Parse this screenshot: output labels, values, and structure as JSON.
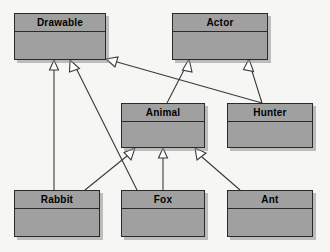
{
  "diagram": {
    "type": "uml-class-diagram",
    "canvas": {
      "width": 330,
      "height": 252
    },
    "style": {
      "background_color": "#f6f6f4",
      "class_fill_color": "#a0a0a0",
      "class_border_color": "#2a2a2a",
      "shadow_color": "#8c8c8c",
      "edge_color": "#3a3a3a",
      "arrowhead_fill": "#ffffff",
      "label_color": "#000000"
    },
    "classes": [
      {
        "id": "drawable",
        "name": "Drawable",
        "x": 14,
        "y": 13,
        "w": 92,
        "h": 47
      },
      {
        "id": "actor",
        "name": "Actor",
        "x": 172,
        "y": 13,
        "w": 96,
        "h": 47
      },
      {
        "id": "animal",
        "name": "Animal",
        "x": 121,
        "y": 103,
        "w": 84,
        "h": 45
      },
      {
        "id": "hunter",
        "name": "Hunter",
        "x": 227,
        "y": 103,
        "w": 86,
        "h": 45
      },
      {
        "id": "rabbit",
        "name": "Rabbit",
        "x": 14,
        "y": 190,
        "w": 86,
        "h": 47
      },
      {
        "id": "fox",
        "name": "Fox",
        "x": 121,
        "y": 190,
        "w": 84,
        "h": 47
      },
      {
        "id": "ant",
        "name": "Ant",
        "x": 227,
        "y": 190,
        "w": 86,
        "h": 47
      }
    ],
    "generalizations": [
      {
        "id": "rabbit-drawable",
        "from": "rabbit",
        "to": "drawable",
        "relation": "generalization",
        "points": "54,190 54,62",
        "head_x": 54,
        "head_y": 61
      },
      {
        "id": "fox-drawable",
        "from": "fox",
        "to": "drawable",
        "relation": "generalization",
        "points": "137,190 73,64",
        "head_x": 70,
        "head_y": 61,
        "head_angle": 63
      },
      {
        "id": "hunter-drawable",
        "from": "hunter",
        "to": "drawable",
        "relation": "generalization",
        "points": "260,103 112,61",
        "head_x": 108,
        "head_y": 60,
        "head_angle": 105
      },
      {
        "id": "animal-actor",
        "from": "animal",
        "to": "actor",
        "relation": "generalization",
        "points": "168,103 188,62",
        "head_x": 189,
        "head_y": 61,
        "head_angle": -26
      },
      {
        "id": "hunter-actor",
        "from": "hunter",
        "to": "actor",
        "relation": "generalization",
        "points": "262,103 250,63",
        "head_x": 249,
        "head_y": 61,
        "head_angle": 16
      },
      {
        "id": "rabbit-animal",
        "from": "rabbit",
        "to": "animal",
        "relation": "generalization",
        "points": "85,190 130,152",
        "head_x": 133,
        "head_y": 149,
        "head_angle": -50
      },
      {
        "id": "fox-animal",
        "from": "fox",
        "to": "animal",
        "relation": "generalization",
        "points": "163,190 163,152",
        "head_x": 163,
        "head_y": 149
      },
      {
        "id": "ant-animal",
        "from": "ant",
        "to": "animal",
        "relation": "generalization",
        "points": "240,190 200,152",
        "head_x": 197,
        "head_y": 149,
        "head_angle": 45
      }
    ]
  }
}
